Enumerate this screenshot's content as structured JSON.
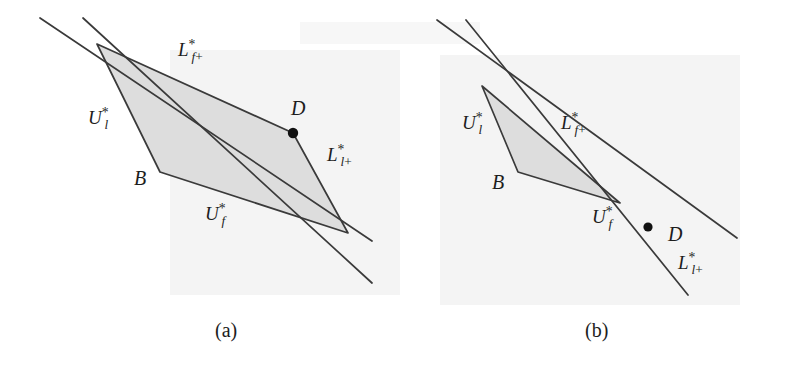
{
  "figure": {
    "background_color": "#ffffff",
    "line_color": "#3a3a3a",
    "fill_color": "#dcdcdc",
    "point_color": "#111111",
    "panels": [
      {
        "id": "a",
        "caption": "(a)",
        "caption_pos": [
          215,
          320
        ],
        "region_fill": "#dddddd",
        "polygon": [
          [
            97,
            44
          ],
          [
            293,
            133
          ],
          [
            348,
            233
          ],
          [
            160,
            172
          ]
        ],
        "points": [
          {
            "name": "D",
            "x": 293,
            "y": 133,
            "radius": 5.2
          }
        ],
        "lines": [
          {
            "name": "L_f_plus",
            "x1": 40,
            "y1": 18,
            "x2": 372,
            "y2": 241
          },
          {
            "name": "U_l_star",
            "x1": 83,
            "y1": 18,
            "x2": 372,
            "y2": 283
          }
        ],
        "labels": [
          {
            "name": "label-L-f-plus",
            "base": "L",
            "sup": "*",
            "sub": "f+",
            "x": 178,
            "y": 40
          },
          {
            "name": "label-U-l-star",
            "base": "U",
            "sup": "*",
            "sub": "l",
            "x": 88,
            "y": 108
          },
          {
            "name": "label-L-l-plus",
            "base": "L",
            "sup": "*",
            "sub": "l+",
            "x": 327,
            "y": 145
          },
          {
            "name": "label-U-f-star",
            "base": "U",
            "sup": "*",
            "sub": "f",
            "x": 205,
            "y": 204
          },
          {
            "name": "label-point-D",
            "text": "D",
            "x": 291,
            "y": 98
          },
          {
            "name": "label-point-B",
            "text": "B",
            "x": 134,
            "y": 168
          }
        ]
      },
      {
        "id": "b",
        "caption": "(b)",
        "caption_pos": [
          585,
          320
        ],
        "region_fill": "#dddddd",
        "polygon": [
          [
            482,
            86
          ],
          [
            620,
            203
          ],
          [
            518,
            172
          ]
        ],
        "points": [
          {
            "name": "D",
            "x": 648,
            "y": 227,
            "radius": 4.6
          }
        ],
        "lines": [
          {
            "name": "L_f_plus",
            "x1": 437,
            "y1": 20,
            "x2": 737,
            "y2": 238
          },
          {
            "name": "U_l_star",
            "x1": 466,
            "y1": 20,
            "x2": 688,
            "y2": 295
          }
        ],
        "labels": [
          {
            "name": "label-U-l-star",
            "base": "U",
            "sup": "*",
            "sub": "l",
            "x": 462,
            "y": 113
          },
          {
            "name": "label-L-f-plus",
            "base": "L",
            "sup": "*",
            "sub": "f+",
            "x": 561,
            "y": 113
          },
          {
            "name": "label-U-f-star",
            "base": "U",
            "sup": "*",
            "sub": "f",
            "x": 592,
            "y": 207
          },
          {
            "name": "label-L-l-plus",
            "base": "L",
            "sup": "*",
            "sub": "l+",
            "x": 678,
            "y": 253
          },
          {
            "name": "label-point-D",
            "text": "D",
            "x": 668,
            "y": 224
          },
          {
            "name": "label-point-B",
            "text": "B",
            "x": 492,
            "y": 172
          }
        ]
      }
    ],
    "scan_tints": [
      {
        "x": 170,
        "y": 50,
        "w": 230,
        "h": 245,
        "color": "#f4f4f4"
      },
      {
        "x": 440,
        "y": 55,
        "w": 300,
        "h": 250,
        "color": "#f4f4f4"
      },
      {
        "x": 300,
        "y": 22,
        "w": 180,
        "h": 22,
        "color": "#f7f7f7"
      }
    ]
  }
}
